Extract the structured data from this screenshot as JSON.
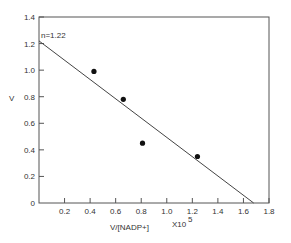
{
  "chart_data": {
    "type": "scatter",
    "title": "",
    "xlabel": "V/[NADP+]",
    "xlabel_multiplier": "X10",
    "xlabel_exponent": "5",
    "ylabel": "V",
    "xlim": [
      0,
      1.8
    ],
    "ylim": [
      0,
      1.4
    ],
    "grid": false,
    "legend": "none",
    "x_ticks": [
      0.2,
      0.4,
      0.6,
      0.8,
      1.0,
      1.2,
      1.4,
      1.6,
      1.8
    ],
    "x_tick_labels": [
      "0.2",
      "0.4",
      "0.6",
      "0.8",
      "1.0",
      "1.2",
      "1.4",
      "1.6",
      "1.8"
    ],
    "y_ticks": [
      0,
      0.2,
      0.4,
      0.6,
      0.8,
      1.0,
      1.2,
      1.4
    ],
    "y_tick_labels": [
      "0",
      "0.2",
      "0.4",
      "0.6",
      "0.8",
      "1.0",
      "1.2",
      "1.4"
    ],
    "series": [
      {
        "name": "data",
        "type": "scatter",
        "x": [
          0.43,
          0.66,
          0.81,
          1.24
        ],
        "y": [
          0.99,
          0.78,
          0.45,
          0.35
        ]
      },
      {
        "name": "fit",
        "type": "line",
        "x": [
          0,
          1.68
        ],
        "y": [
          1.22,
          0
        ]
      }
    ],
    "annotations": [
      {
        "text": "n=1.22",
        "x": 0.02,
        "y": 1.28
      }
    ]
  },
  "labels": {
    "annotation": "n=1.22",
    "ylabel": "V",
    "xlabel_main": "V/[NADP+]",
    "xlabel_mult": "X10",
    "xlabel_exp": "5"
  }
}
